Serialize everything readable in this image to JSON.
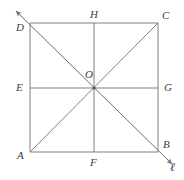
{
  "figure": {
    "type": "geometry-diagram",
    "stroke_color": "#808080",
    "label_color": "#3c3c3c",
    "background_color": "#ffffff",
    "stroke_width": 1,
    "square": {
      "corners": [
        {
          "name": "A",
          "x": 30,
          "y": 152,
          "label_x": 17,
          "label_y": 150
        },
        {
          "name": "B",
          "x": 158,
          "y": 152,
          "label_x": 163,
          "label_y": 139
        },
        {
          "name": "C",
          "x": 158,
          "y": 23,
          "label_x": 162,
          "label_y": 10
        },
        {
          "name": "D",
          "x": 30,
          "y": 23,
          "label_x": 16,
          "label_y": 22
        }
      ]
    },
    "midpoints": [
      {
        "name": "E",
        "x": 30,
        "y": 88,
        "label_x": 16,
        "label_y": 82
      },
      {
        "name": "F",
        "x": 94,
        "y": 152,
        "label_x": 90,
        "label_y": 157
      },
      {
        "name": "G",
        "x": 158,
        "y": 88,
        "label_x": 164,
        "label_y": 82
      },
      {
        "name": "H",
        "x": 94,
        "y": 23,
        "label_x": 90,
        "label_y": 9
      }
    ],
    "center": {
      "name": "O",
      "x": 94,
      "y": 88,
      "label_x": 85,
      "label_y": 69
    },
    "segments": [
      {
        "name": "side-DC-top",
        "x1": 30,
        "y1": 23,
        "x2": 158,
        "y2": 23
      },
      {
        "name": "side-AB-bottom",
        "x1": 30,
        "y1": 152,
        "x2": 158,
        "y2": 152
      },
      {
        "name": "side-AD-left",
        "x1": 30,
        "y1": 23,
        "x2": 30,
        "y2": 152
      },
      {
        "name": "side-BC-right",
        "x1": 158,
        "y1": 23,
        "x2": 158,
        "y2": 152
      },
      {
        "name": "midline-HF-vertical",
        "x1": 94,
        "y1": 23,
        "x2": 94,
        "y2": 152
      },
      {
        "name": "midline-EG-horizontal",
        "x1": 30,
        "y1": 88,
        "x2": 158,
        "y2": 88
      },
      {
        "name": "diagonal-AC",
        "x1": 30,
        "y1": 152,
        "x2": 158,
        "y2": 23
      }
    ],
    "line_l": {
      "label": "ℓ",
      "label_x": 170,
      "label_y": 161,
      "through": [
        "D",
        "O",
        "B"
      ],
      "x1": 16,
      "y1": 11,
      "x2": 172,
      "y2": 164,
      "arrow_start": true,
      "arrow_end": true
    }
  }
}
